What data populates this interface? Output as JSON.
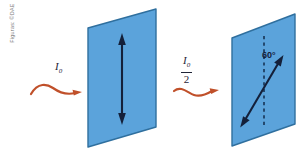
{
  "figure": {
    "credit": "Figuras: ©DAE",
    "background_color": "#ffffff",
    "panel_fill_color": "#5ba3db",
    "panel_edge_color": "#2f6f9e",
    "wave_color": "#c0502a",
    "arrow_color": "#14203a",
    "dashed_line_color": "#1b3a5c"
  },
  "incoming_wave": {
    "label_main": "I",
    "label_sub": "0",
    "name": "incident-intensity"
  },
  "transmitted_wave": {
    "numerator_main": "I",
    "numerator_sub": "0",
    "denominator": "2",
    "name": "transmitted-intensity"
  },
  "polarizer_one": {
    "name": "first-polarizer",
    "transmission_axis": "vertical"
  },
  "polarizer_two": {
    "name": "second-polarizer",
    "angle_label": "60°",
    "transmission_axis": "tilted"
  }
}
